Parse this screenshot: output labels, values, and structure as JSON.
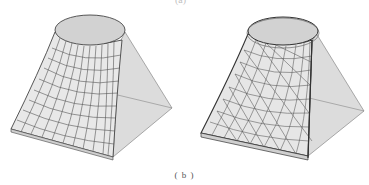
{
  "figure": {
    "top_label": "(a)",
    "caption": "( b )",
    "panels": [
      {
        "name": "quad-mesh-surface",
        "mesh_type": "quadrilateral",
        "top_shape": "circle",
        "base_shape": "square"
      },
      {
        "name": "triangle-mesh-surface",
        "mesh_type": "triangular",
        "top_shape": "circle",
        "base_shape": "square"
      }
    ]
  },
  "colors": {
    "surface_fill": "#e6e6e6",
    "side_fill": "#d9d9d9",
    "top_fill": "#d2d2d2",
    "mesh_line": "#555555",
    "outline": "#444444"
  }
}
